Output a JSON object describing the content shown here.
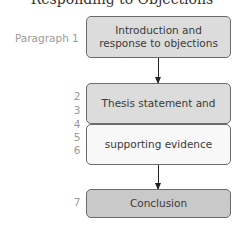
{
  "title_clipped": "Responding to Objections",
  "boxes": [
    {
      "label": "Introduction and response to objections",
      "fill": "#dcdcdc"
    },
    {
      "label": "Thesis statement and",
      "fill": "#dcdcdc"
    },
    {
      "label": "supporting evidence",
      "fill": "#f8f8f8"
    },
    {
      "label": "Conclusion",
      "fill": "#c9c9c9"
    }
  ],
  "side_labels": {
    "paragraph": "Paragraph 1",
    "numbers": [
      "2",
      "3",
      "4",
      "5",
      "6",
      "7"
    ]
  }
}
